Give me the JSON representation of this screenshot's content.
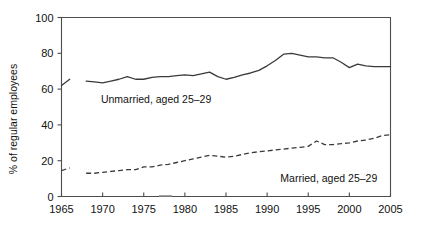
{
  "chart_data": {
    "type": "line",
    "title": "",
    "subtitle": "",
    "xlabel": "",
    "ylabel": "% of regular employees",
    "xlim": [
      1965,
      2005
    ],
    "ylim": [
      0,
      100
    ],
    "grid": false,
    "legend_position": "inline-annotation",
    "x_ticks": [
      1965,
      1970,
      1975,
      1980,
      1985,
      1990,
      1995,
      2000,
      2005
    ],
    "y_ticks": [
      0,
      20,
      40,
      60,
      80,
      100
    ],
    "x_tick_labels": [
      "1965",
      "1970",
      "1975",
      "1980",
      "1985",
      "1990",
      "1995",
      "2000",
      "2005"
    ],
    "y_tick_labels": [
      "0",
      "20",
      "40",
      "60",
      "80",
      "100"
    ],
    "annotations": [
      {
        "text": "Unmarried, aged 25–29",
        "x": 1976.5,
        "y": 52
      },
      {
        "text": "Married, aged 25–29",
        "x": 1997.5,
        "y": 8
      }
    ],
    "series": [
      {
        "name": "Unmarried, aged 25–29",
        "style": "solid",
        "color": "#3a3a3a",
        "x": [
          1965,
          1966,
          1968,
          1969,
          1970,
          1971,
          1972,
          1973,
          1974,
          1975,
          1976,
          1977,
          1978,
          1979,
          1980,
          1981,
          1982,
          1983,
          1984,
          1985,
          1986,
          1987,
          1988,
          1989,
          1990,
          1991,
          1992,
          1993,
          1994,
          1995,
          1996,
          1997,
          1998,
          1999,
          2000,
          2001,
          2002,
          2003,
          2004,
          2005
        ],
        "values": [
          62,
          65.5,
          64.5,
          64,
          63.5,
          64.5,
          65.5,
          67,
          65.5,
          65.5,
          66.5,
          67,
          67,
          67.5,
          68,
          67.5,
          68.5,
          69.5,
          67,
          65.5,
          66.5,
          68,
          69,
          70.5,
          73,
          76,
          79.5,
          80,
          79,
          78,
          78,
          77.5,
          77.5,
          75,
          72,
          74,
          73,
          72.5,
          72.5,
          72.5
        ]
      },
      {
        "name": "Married, aged 25–29",
        "style": "dashed",
        "color": "#3a3a3a",
        "x": [
          1965,
          1966,
          1968,
          1969,
          1970,
          1971,
          1972,
          1973,
          1974,
          1975,
          1976,
          1977,
          1978,
          1979,
          1980,
          1981,
          1982,
          1983,
          1984,
          1985,
          1986,
          1987,
          1988,
          1989,
          1990,
          1991,
          1992,
          1993,
          1994,
          1995,
          1996,
          1997,
          1998,
          1999,
          2000,
          2001,
          2002,
          2003,
          2004,
          2005
        ],
        "values": [
          14.5,
          16,
          13,
          13,
          13.5,
          14,
          14.5,
          15,
          15,
          16.5,
          16.5,
          17.5,
          18,
          19,
          20,
          21,
          22,
          23,
          22.5,
          22,
          22.5,
          23.5,
          24.5,
          25,
          25.5,
          26,
          26.5,
          27,
          27.5,
          28,
          31,
          29,
          29,
          29.5,
          30,
          31,
          31.5,
          32.5,
          34,
          34.5
        ]
      }
    ]
  }
}
